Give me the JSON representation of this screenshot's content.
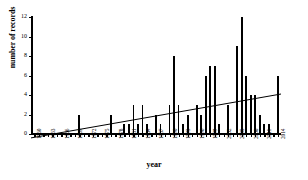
{
  "chart_data": {
    "type": "bar",
    "title": "",
    "xlabel": "year",
    "ylabel": "number of records",
    "ylim": [
      0,
      12
    ],
    "yticks": [
      0,
      2,
      4,
      6,
      8,
      10,
      12
    ],
    "grid": false,
    "legend": null,
    "xtick_label_interval": 3,
    "categories": [
      "1960",
      "1961",
      "1962",
      "1963",
      "1964",
      "1965",
      "1966",
      "1967",
      "1968",
      "1969",
      "1970",
      "1971",
      "1972",
      "1973",
      "1974",
      "1975",
      "1976",
      "1977",
      "1978",
      "1979",
      "1980",
      "1981",
      "1982",
      "1983",
      "1984",
      "1985",
      "1986",
      "1987",
      "1988",
      "1989",
      "1990",
      "1991",
      "1992",
      "1993",
      "1994",
      "1995",
      "1996",
      "1997",
      "1998",
      "1999",
      "2000",
      "2001",
      "2002",
      "2003",
      "2004",
      "2005",
      "2006",
      "2007",
      "2008",
      "2009",
      "2010",
      "2011",
      "2012",
      "2013",
      "2014"
    ],
    "values": [
      0,
      0,
      0,
      0,
      0,
      0,
      0,
      0,
      0,
      0,
      2,
      0,
      0,
      0,
      0,
      0,
      0,
      2,
      0,
      0,
      1,
      1,
      3,
      1,
      3,
      1,
      0,
      2,
      1,
      0,
      3,
      8,
      3,
      1,
      2,
      0,
      3,
      2,
      6,
      7,
      7,
      1,
      0,
      3,
      0,
      9,
      12,
      6,
      4,
      4,
      2,
      1,
      1,
      0,
      6
    ],
    "series": [
      {
        "name": "number of records",
        "values": [
          0,
          0,
          0,
          0,
          0,
          0,
          0,
          0,
          0,
          0,
          2,
          0,
          0,
          0,
          0,
          0,
          0,
          2,
          0,
          0,
          1,
          1,
          3,
          1,
          3,
          1,
          0,
          2,
          1,
          0,
          3,
          8,
          3,
          1,
          2,
          0,
          3,
          2,
          6,
          7,
          7,
          1,
          0,
          3,
          0,
          9,
          12,
          6,
          4,
          4,
          2,
          1,
          1,
          0,
          6
        ]
      }
    ],
    "trendline": {
      "type": "linear",
      "x_start": "1960",
      "x_end": "2014",
      "y_start": -0.4,
      "y_end": 4.1
    }
  }
}
